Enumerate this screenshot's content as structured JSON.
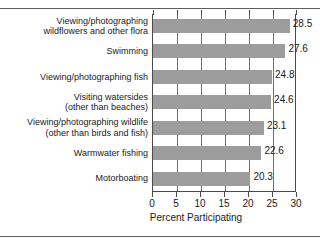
{
  "chart_data": {
    "type": "bar",
    "orientation": "horizontal",
    "title": "",
    "xlabel": "Percent Participating",
    "ylabel": "",
    "xlim": [
      0,
      30
    ],
    "xticks": [
      "0",
      "5",
      "10",
      "15",
      "20",
      "25",
      "30"
    ],
    "grid": true,
    "legend": null,
    "bar_color": "#9c9c9c",
    "categories": [
      "Viewing/photographing\nwildflowers and other flora",
      "Swimming",
      "Viewing/photographing fish",
      "Visiting watersides\n(other than beaches)",
      "Viewing/photographing wildlife\n(other than birds and fish)",
      "Warmwater fishing",
      "Motorboating"
    ],
    "category_lines": [
      [
        "Viewing/photographing",
        "wildflowers and other flora"
      ],
      [
        "Swimming"
      ],
      [
        "Viewing/photographing fish"
      ],
      [
        "Visiting watersides",
        "(other than beaches)"
      ],
      [
        "Viewing/photographing wildlife",
        "(other than birds and fish)"
      ],
      [
        "Warmwater fishing"
      ],
      [
        "Motorboating"
      ]
    ],
    "values": [
      28.5,
      27.6,
      24.8,
      24.6,
      23.1,
      22.6,
      20.3
    ],
    "value_labels": [
      "28.5",
      "27.6",
      "24.8",
      "24.6",
      "23.1",
      "22.6",
      "20.3"
    ]
  }
}
